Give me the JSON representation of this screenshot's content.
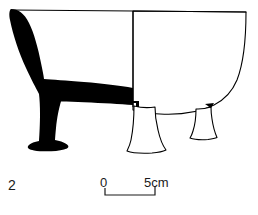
{
  "figure": {
    "number": "2",
    "caption_number_position": "bottom-left",
    "style": "ink line drawing; left half solid black cross-section, right half outline exterior profile",
    "background_color": "#ffffff",
    "ink_color": "#000000",
    "section_fill_color": "#000000"
  },
  "scale": {
    "start_label": "0",
    "end_label": "5cm",
    "unit": "cm",
    "length_value": "5",
    "bar_style": "bracket with upward end ticks"
  },
  "drawing_elements": {
    "rim_line": "horizontal rim spanning full vessel width",
    "centerline": "vertical axis dividing section from profile",
    "section_half": "solid black cross-section of wall, base and one leg",
    "profile_half": "outlined exterior showing curved body wall and two tripod legs",
    "leg_count": "3",
    "legs_visible_in_profile": "2"
  }
}
